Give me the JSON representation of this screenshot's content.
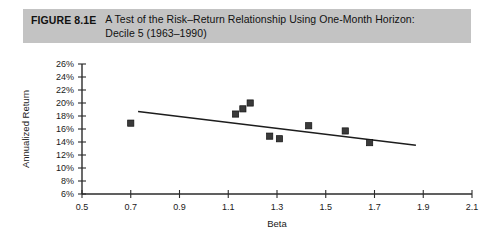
{
  "figure": {
    "label": "FIGURE 8.1E",
    "title_line1": "A Test of the Risk–Return Relationship Using One-Month Horizon:",
    "title_line2": "Decile 5 (1963–1990)",
    "banner_color": "#c3c3c3"
  },
  "chart_data": {
    "type": "scatter",
    "title": "A Test of the Risk–Return Relationship Using One-Month Horizon: Decile 5 (1963–1990)",
    "xlabel": "Beta",
    "ylabel": "Annualized Return",
    "xlim": [
      0.5,
      2.1
    ],
    "ylim": [
      6,
      26
    ],
    "xticks": [
      0.5,
      0.7,
      0.9,
      1.1,
      1.3,
      1.5,
      1.7,
      1.9,
      2.1
    ],
    "xtick_labels": [
      "0.5",
      "0.7",
      "0.9",
      "1.1",
      "1.3",
      "1.5",
      "1.7",
      "1.9",
      "2.1"
    ],
    "yticks": [
      6,
      8,
      10,
      12,
      14,
      16,
      18,
      20,
      22,
      24,
      26
    ],
    "ytick_labels": [
      "6%",
      "8%",
      "10%",
      "12%",
      "14%",
      "16%",
      "18%",
      "20%",
      "22%",
      "24%",
      "26%"
    ],
    "grid": false,
    "legend": false,
    "marker": "square",
    "marker_color": "#3a3a3a",
    "points": [
      {
        "x": 0.7,
        "y": 16.9
      },
      {
        "x": 1.13,
        "y": 18.3
      },
      {
        "x": 1.16,
        "y": 19.1
      },
      {
        "x": 1.19,
        "y": 20.0
      },
      {
        "x": 1.27,
        "y": 14.9
      },
      {
        "x": 1.31,
        "y": 14.5
      },
      {
        "x": 1.43,
        "y": 16.5
      },
      {
        "x": 1.58,
        "y": 15.7
      },
      {
        "x": 1.68,
        "y": 13.9
      }
    ],
    "trendline": {
      "x0": 0.73,
      "y0": 18.7,
      "x1": 1.87,
      "y1": 13.5,
      "color": "#1d1d1d"
    }
  }
}
